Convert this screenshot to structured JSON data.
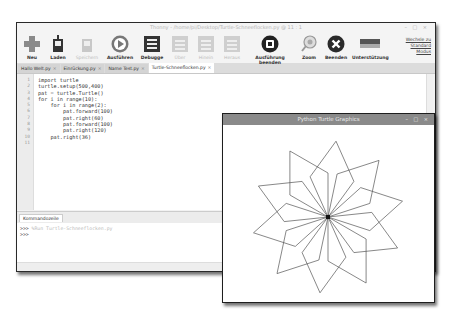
{
  "thonny": {
    "title": "Thonny - /home/pi/Desktop/Turtle-Schneeflocken.py @ 11 : 1",
    "window_controls": "– □ ×",
    "toolbar": {
      "new": "Neu",
      "load": "Laden",
      "save": "Speichern",
      "run": "Ausführen",
      "debug": "Debugge",
      "step_over": "Über",
      "step_into": "Hinein",
      "step_out": "Heraus",
      "stop": "Ausführung beenden",
      "zoom": "Zoom",
      "quit": "Beenden",
      "support": "Unterstützung",
      "switch_mode": [
        "Wechsle zu",
        "Standard",
        "Modus"
      ]
    },
    "tabs": [
      {
        "label": "Hallo Welt.py",
        "active": false
      },
      {
        "label": "Einrückung.py",
        "active": false
      },
      {
        "label": "Name Test.py",
        "active": false
      },
      {
        "label": "Turtle-Schneeflocken.py",
        "active": true
      }
    ],
    "editor": {
      "line_numbers": [
        "1",
        "2",
        "3",
        "4",
        "5",
        "6",
        "7",
        "8",
        "9",
        "10",
        "11"
      ],
      "lines": [
        "import turtle",
        "turtle.setup(500,400)",
        "pat = turtle.Turtle()",
        "for i in range(10):",
        "    for i in range(2):",
        "        pat.forward(100)",
        "        pat.right(60)",
        "        pat.forward(100)",
        "        pat.right(120)",
        "    pat.right(36)",
        ""
      ]
    },
    "shell": {
      "tab_label": "Kommandozeile",
      "lines": [
        {
          "prompt": ">>>",
          "text": "%Run Turtle-Schneeflocken.py"
        },
        {
          "prompt": ">>>",
          "text": ""
        }
      ]
    }
  },
  "turtle_window": {
    "title": "Python Turtle Graphics",
    "window_controls": "– □ ×",
    "drawing": {
      "center_x": 105,
      "center_y": 92,
      "step": 100,
      "scale": 0.44,
      "petals": 10,
      "petal_turn": 36,
      "line_color": "#555555"
    }
  }
}
